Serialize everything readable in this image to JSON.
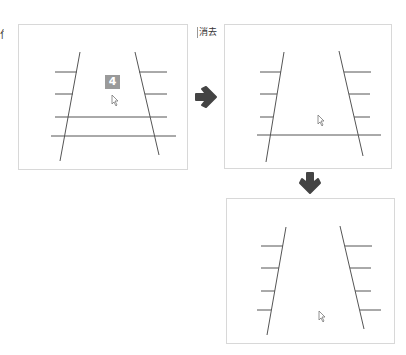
{
  "label": "消去",
  "edge_text": "付",
  "panels": [
    {
      "id": "before",
      "badge": "4"
    },
    {
      "id": "after-right"
    },
    {
      "id": "after-bottom"
    }
  ],
  "colors": {
    "line": "#555555",
    "arrow": "#444444",
    "badge": "#9a9a9a",
    "border": "#d8d8d8"
  }
}
